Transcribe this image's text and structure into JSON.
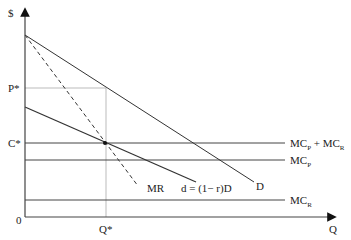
{
  "diagram": {
    "title": "",
    "axes": {
      "y_label": "$",
      "x_label": "Q",
      "origin_label": "0"
    },
    "tick_labels": {
      "price": "P*",
      "cost": "C*",
      "quantity": "Q*"
    },
    "curves": [
      {
        "id": "D",
        "label": "D",
        "style": "solid"
      },
      {
        "id": "MR",
        "label": "MR",
        "style": "dashed"
      },
      {
        "id": "d",
        "label": "d = (1− r)D",
        "style": "solid"
      },
      {
        "id": "MCP_MCR",
        "label_main": "MC",
        "label_sub1": "P",
        "label_plus": " + MC",
        "label_sub2": "R",
        "style": "solid"
      },
      {
        "id": "MCP",
        "label_main": "MC",
        "label_sub": "P",
        "style": "solid"
      },
      {
        "id": "MCR",
        "label_main": "MC",
        "label_sub": "R",
        "style": "solid"
      }
    ],
    "colors": {
      "line": "#333333",
      "guide": "#999999"
    }
  }
}
